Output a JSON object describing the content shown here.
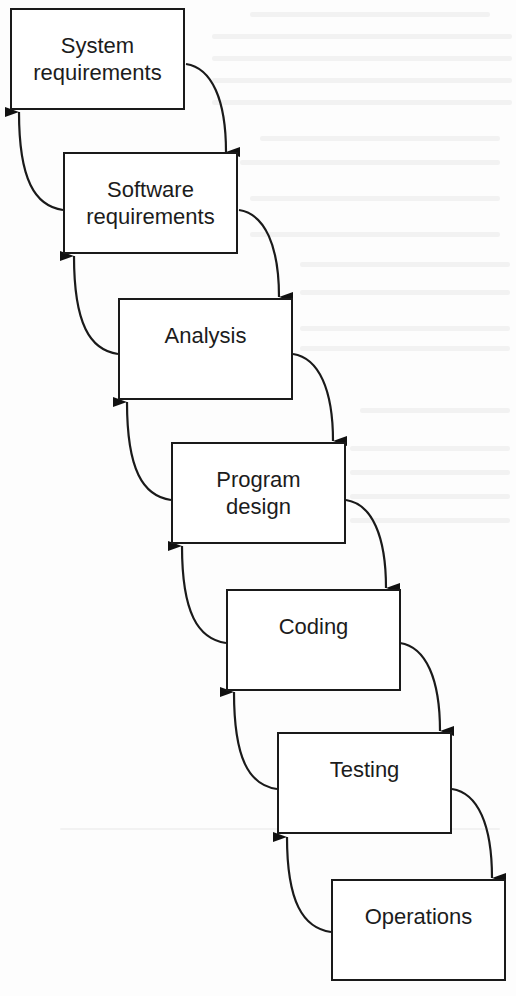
{
  "diagram": {
    "type": "waterfall-model",
    "stages": [
      {
        "lines": [
          "System",
          "requirements"
        ]
      },
      {
        "lines": [
          "Software",
          "requirements"
        ]
      },
      {
        "lines": [
          "Analysis"
        ]
      },
      {
        "lines": [
          "Program",
          "design"
        ]
      },
      {
        "lines": [
          "Coding"
        ]
      },
      {
        "lines": [
          "Testing"
        ]
      },
      {
        "lines": [
          "Operations"
        ]
      }
    ],
    "edges": {
      "forward": "each stage flows down to the next stage",
      "feedback": "each stage has a return arrow up to the previous stage"
    },
    "colors": {
      "stroke": "#1a1a1a",
      "box_fill": "#ffffff",
      "background": "#fdfdfd"
    }
  }
}
